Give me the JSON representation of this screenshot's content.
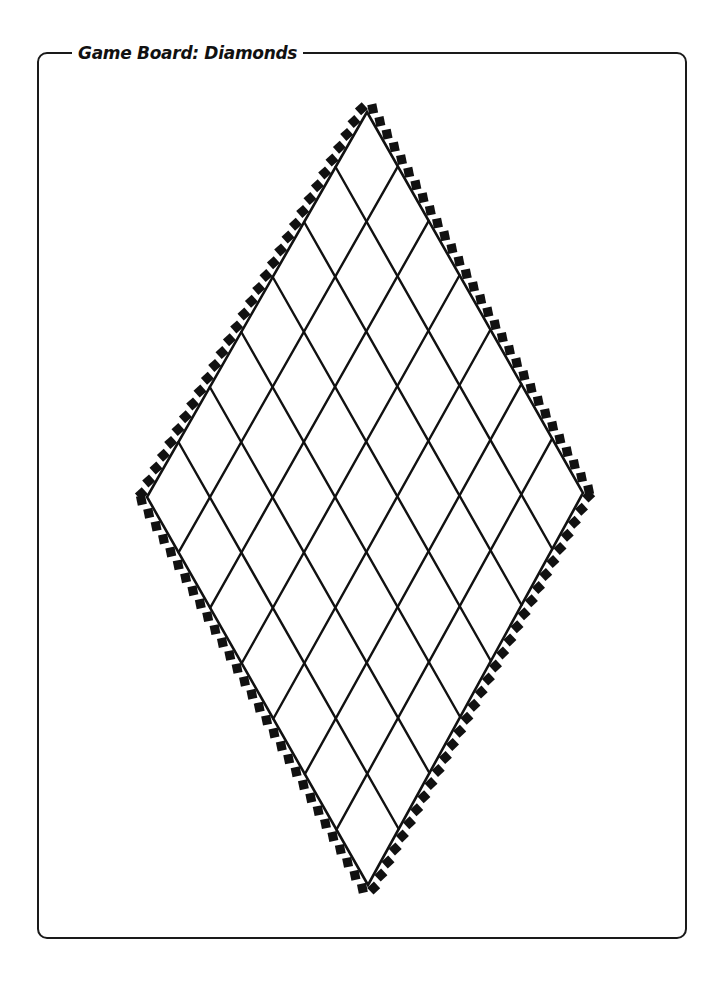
{
  "page": {
    "title": "Game Board: Diamonds"
  },
  "board": {
    "shape": "diamond",
    "grid_divisions": 7,
    "vertices": {
      "top": [
        367,
        112
      ],
      "right": [
        583,
        493
      ],
      "bottom": [
        368,
        885
      ],
      "left": [
        147,
        497
      ]
    },
    "border_teeth_per_edge": 30,
    "line_color": "#111111",
    "fill_color": "#ffffff"
  }
}
